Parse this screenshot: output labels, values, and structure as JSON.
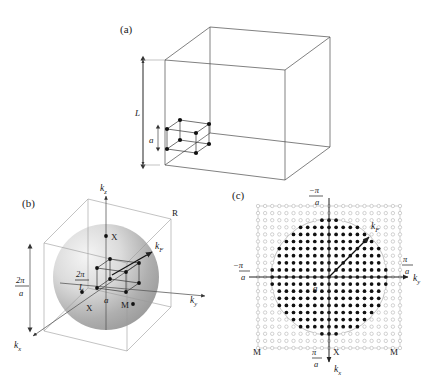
{
  "figure": {
    "panels": [
      {
        "id": "a",
        "label": "(a)",
        "description": "Real-space cubic box of side L containing a small cubic lattice cell of side a",
        "dimensions": [
          {
            "name": "box-side",
            "label": "L"
          },
          {
            "name": "lattice-constant",
            "label": "a"
          }
        ]
      },
      {
        "id": "b",
        "label": "(b)",
        "description": "Reciprocal-space Brillouin zone cube with Fermi sphere and allowed k-point mesh",
        "axes": [
          {
            "name": "kz",
            "label": "k",
            "sub": "z"
          },
          {
            "name": "ky",
            "label": "k",
            "sub": "y"
          },
          {
            "name": "kx",
            "label": "k",
            "sub": "x"
          }
        ],
        "vectors": [
          {
            "name": "fermi-wavevector",
            "label": "k",
            "sub": "F"
          }
        ],
        "dimensions": [
          {
            "name": "bz-size",
            "num": "2π",
            "den": "a"
          },
          {
            "name": "k-mesh-spacing",
            "num": "2π",
            "den": "L"
          },
          {
            "name": "mesh-cell-edge",
            "label": "a"
          }
        ],
        "symmetry_points": [
          {
            "name": "point-R",
            "label": "R"
          },
          {
            "name": "point-X-top",
            "label": "X"
          },
          {
            "name": "point-X-left",
            "label": "X"
          },
          {
            "name": "point-M",
            "label": "M"
          }
        ]
      },
      {
        "id": "c",
        "label": "(c)",
        "description": "Planar cut of reciprocal space: filled circles are occupied k-states inside the Fermi circle, open circles are unoccupied states",
        "axes": [
          {
            "name": "ky",
            "label": "k",
            "sub": "y"
          },
          {
            "name": "kx",
            "label": "k",
            "sub": "x"
          }
        ],
        "vectors": [
          {
            "name": "fermi-wavevector",
            "label": "k",
            "sub": "F"
          }
        ],
        "tick_labels": [
          {
            "name": "tick-top",
            "sign": "−",
            "num": "π",
            "den": "a"
          },
          {
            "name": "tick-bottom",
            "sign": "",
            "num": "π",
            "den": "a"
          },
          {
            "name": "tick-left",
            "sign": "−",
            "num": "π",
            "den": "a"
          },
          {
            "name": "tick-right",
            "sign": "",
            "num": "π",
            "den": "a"
          }
        ],
        "dimensions": [
          {
            "name": "mesh-spacing",
            "label": "a"
          }
        ],
        "symmetry_points": [
          {
            "name": "point-M-left",
            "label": "M"
          },
          {
            "name": "point-X-bottom",
            "label": "X"
          },
          {
            "name": "point-M-right",
            "label": "M"
          }
        ]
      }
    ]
  },
  "chart_data": {
    "type": "scatter",
    "title": "",
    "xlabel": "k_y",
    "ylabel": "k_x",
    "grid": true,
    "legend": "none",
    "panel_c_mesh": {
      "grid_index_min": -10,
      "grid_index_max": 10,
      "spacing_px": 7.1,
      "fermi_radius_index": 8.2,
      "bz_half_width_index": 10,
      "filled_marker": "occupied state",
      "open_marker": "unoccupied state",
      "xlim": [
        "-pi/a",
        "pi/a"
      ],
      "ylim": [
        "-pi/a",
        "pi/a"
      ]
    },
    "panel_b_sphere": {
      "fermi_sphere_radius_frac_of_bz": 0.74,
      "bz_edge": "2pi/a",
      "mesh_spacing": "2pi/L"
    }
  },
  "colors": {
    "background": "#ffffff",
    "ink": "#1a1a1a",
    "edge": "#4a4a4a",
    "edge_light": "#9a9a9a",
    "dot_filled": "#111111",
    "dot_open_stroke": "#b4b4b4",
    "sphere_light": "#f0f0f0",
    "sphere_dark": "#8d8d8d"
  }
}
